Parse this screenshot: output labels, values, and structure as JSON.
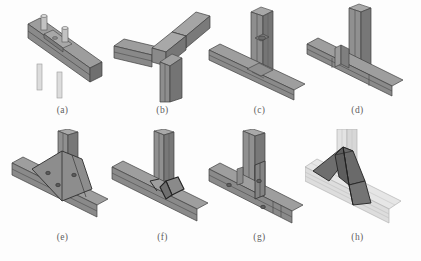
{
  "figure": {
    "background_color": "#fdfdfd",
    "rows": 2,
    "columns": 4,
    "width": 421,
    "height": 261
  },
  "palette": {
    "steel_light": "#b9b9b9",
    "steel_mid": "#8f8f8f",
    "steel_dark": "#6f6f6f",
    "steel_darker": "#575757",
    "outline": "#3a3a3a",
    "bolt_light": "#cfcfcf",
    "bolt_shaft": "#dcdcdc",
    "ghost_fill": "#e3e3e3",
    "gusset_dark": "#6a6a6a",
    "caption_color": "#5e5e5e"
  },
  "panels": [
    {
      "id": "a",
      "caption": "(a)",
      "icon": "isometric-beam-with-bolts",
      "description": "Single inclined I-beam segment with two protruding bolt studs on its top flange and bolt shafts extending below"
    },
    {
      "id": "b",
      "caption": "(b)",
      "icon": "isometric-tee-joint-plain",
      "description": "Tee joint of a horizontal beam meeting a vertical column, plain welded intersection"
    },
    {
      "id": "c",
      "caption": "(c)",
      "icon": "isometric-tee-joint-single-plate",
      "description": "Tee joint with a single shear plate and bolt on the column web"
    },
    {
      "id": "d",
      "caption": "(d)",
      "icon": "isometric-tee-joint-stiffener",
      "description": "Tee joint with a vertical stiffener plate set against the column flange"
    },
    {
      "id": "e",
      "caption": "(e)",
      "icon": "isometric-tee-joint-haunch-plate",
      "description": "Tee joint with a large trapezoidal haunch gusset plate carrying three bolts"
    },
    {
      "id": "f",
      "caption": "(f)",
      "icon": "isometric-tee-joint-small-gusset",
      "description": "Tee joint with a small angled gusset bracket at the beam-column corner"
    },
    {
      "id": "g",
      "caption": "(g)",
      "icon": "isometric-tee-joint-bolted-plate",
      "description": "Tee joint with a bolted end plate and three bolts distributed along the beam"
    },
    {
      "id": "h",
      "caption": "(h)",
      "icon": "isometric-tee-joint-transparent-gusset",
      "description": "Transparent ghosted beam and column revealing dark internal triangular gusset plates"
    }
  ]
}
